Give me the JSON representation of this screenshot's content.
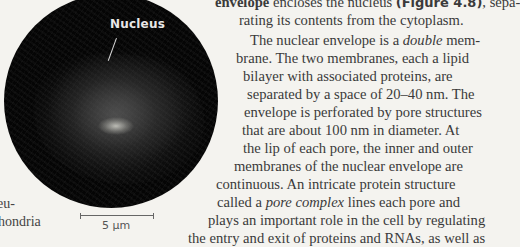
{
  "figure": {
    "label": "Nucleus",
    "scale_bar": "5 µm"
  },
  "margin_fragments": [
    "eu-",
    "hondria"
  ],
  "paragraph1": {
    "line1": {
      "bold_lead": "envelope",
      "text": " encloses the nucleus ",
      "fig_ref": "(Figure 4.8)",
      "tail": ", sepa-"
    },
    "line2": "rating its contents from the cytoplasm."
  },
  "paragraph2": {
    "lines": [
      {
        "pre": "The nuclear envelope is a ",
        "em": "double",
        "post": " mem-"
      },
      {
        "pre": "brane. The two membranes, each a lipid"
      },
      {
        "pre": "bilayer with associated proteins, are"
      },
      {
        "pre": "separated by a space of 20–40 nm. The"
      },
      {
        "pre": "envelope is perforated by pore structures"
      },
      {
        "pre": "that are about 100 nm in diameter. At"
      },
      {
        "pre": "the lip of each pore, the inner and outer"
      },
      {
        "pre": "membranes of the nuclear envelope are"
      },
      {
        "pre": "continuous. An intricate protein structure"
      },
      {
        "pre": "called a ",
        "em": "pore complex",
        "post": " lines each pore and"
      },
      {
        "pre": "plays an important role in the cell by regulating"
      },
      {
        "pre": "the entry and exit of proteins and RNAs, as well as"
      }
    ]
  }
}
